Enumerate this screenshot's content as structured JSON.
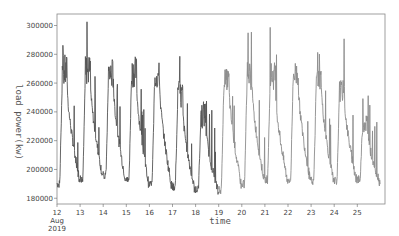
{
  "chart_data": {
    "type": "line",
    "title": "",
    "xlabel": "time",
    "ylabel": "load power(kw)",
    "ylim": [
      180000,
      305000
    ],
    "yticks": [
      180000,
      200000,
      220000,
      240000,
      260000,
      280000,
      300000
    ],
    "ytick_labels": [
      "180000",
      "200000",
      "220000",
      "240000",
      "260000",
      "280000",
      "300000"
    ],
    "xtick_labels": [
      "12",
      "13",
      "14",
      "15",
      "16",
      "17",
      "18",
      "19",
      "20",
      "21",
      "22",
      "23",
      "24",
      "25"
    ],
    "xtick_sublabel": [
      "Aug",
      "2019"
    ],
    "grid": false,
    "legend": null,
    "series": [
      {
        "name": "load power (Aug 12-19)",
        "color": "#555555",
        "days": [
          "12",
          "13",
          "14",
          "15",
          "16",
          "17",
          "18"
        ],
        "daily_peak_band": [
          [
            255000,
            280000
          ],
          [
            258000,
            280000
          ],
          [
            255000,
            278000
          ],
          [
            257000,
            279000
          ],
          [
            255000,
            275000
          ],
          [
            240000,
            262000
          ],
          [
            228000,
            248000
          ]
        ],
        "daily_min": [
          187000,
          191000,
          193000,
          190000,
          187000,
          185000,
          183000
        ],
        "daily_spike_max": [
          290000,
          305000,
          292000,
          289000,
          287000,
          280000,
          263000
        ]
      },
      {
        "name": "load power (Aug 19-26)",
        "color": "#8c8c8c",
        "days": [
          "19",
          "20",
          "21",
          "22",
          "23",
          "24",
          "25"
        ],
        "daily_peak_band": [
          [
            255000,
            270000
          ],
          [
            255000,
            275000
          ],
          [
            255000,
            275000
          ],
          [
            257000,
            276000
          ],
          [
            255000,
            272000
          ],
          [
            247000,
            262000
          ],
          [
            225000,
            240000
          ]
        ],
        "daily_min": [
          183000,
          187000,
          190000,
          190000,
          189000,
          189000,
          190000
        ],
        "daily_spike_max": [
          272000,
          298000,
          301000,
          288000,
          282000,
          292000,
          250000
        ]
      }
    ]
  }
}
